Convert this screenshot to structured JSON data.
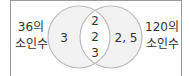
{
  "diagram": {
    "type": "venn",
    "left_set": {
      "label_line1": "36의",
      "label_line2": "소인수",
      "only_elements": "3"
    },
    "right_set": {
      "label_line1": "120의",
      "label_line2": "소인수",
      "only_elements": "2, 5"
    },
    "intersection": {
      "elements": [
        "2",
        "2",
        "3"
      ]
    },
    "colors": {
      "circle_fill": "#f2f2f2",
      "circle_stroke": "#bcbcbc",
      "overlap_fill": "#ffffff",
      "frame_border": "#9a9a9a",
      "text": "#333333"
    }
  }
}
